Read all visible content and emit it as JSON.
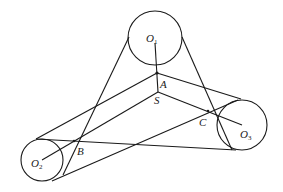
{
  "diagram": {
    "type": "belt-pulley geometry",
    "circles": [
      {
        "id": "O1",
        "label": "O",
        "sub": "1",
        "cx": 155,
        "cy": 38,
        "r": 27,
        "lx": 146,
        "ly": 42
      },
      {
        "id": "O2",
        "label": "O",
        "sub": "2",
        "cx": 42,
        "cy": 160,
        "r": 21,
        "lx": 31,
        "ly": 167
      },
      {
        "id": "O3",
        "label": "O",
        "sub": "3",
        "cx": 242,
        "cy": 125,
        "r": 25,
        "lx": 240,
        "ly": 138
      }
    ],
    "points": [
      {
        "id": "A",
        "label": "A",
        "x": 157,
        "y": 73,
        "lx": 160,
        "ly": 88
      },
      {
        "id": "S",
        "label": "S",
        "x": 158,
        "y": 92,
        "lx": 154,
        "ly": 104
      },
      {
        "id": "B",
        "label": "B",
        "x": 74,
        "y": 141,
        "lx": 77,
        "ly": 155
      },
      {
        "id": "C",
        "label": "C",
        "x": 208,
        "y": 111,
        "lx": 199,
        "ly": 126
      }
    ],
    "stroke_color": "#1a1a1a"
  }
}
